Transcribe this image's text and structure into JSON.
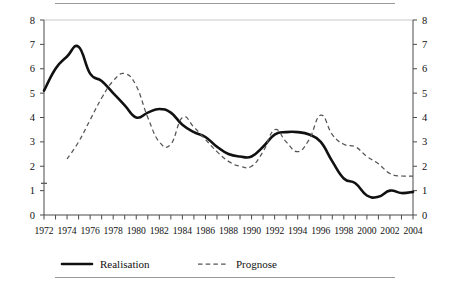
{
  "figure": {
    "name": "line-chart-realisation-prognose",
    "top_rule": "",
    "bottom_rule": ""
  },
  "chart_data": {
    "type": "line",
    "title": "",
    "subtitle": "",
    "xlabel": "",
    "ylabel": "",
    "xlim": [
      1972,
      2004
    ],
    "ylim": [
      0,
      8
    ],
    "grid": false,
    "legend_position": "bottom",
    "y_ticks": [
      0,
      1,
      2,
      3,
      4,
      5,
      6,
      7,
      8
    ],
    "y_tick_labels_left": [
      "0",
      "1",
      "2",
      "3",
      "4",
      "5",
      "6",
      "7",
      "8"
    ],
    "y_tick_labels_right": [
      "0",
      "1",
      "2",
      "3",
      "4",
      "5",
      "6",
      "7",
      "8"
    ],
    "x_ticks": [
      1972,
      1973,
      1974,
      1975,
      1976,
      1977,
      1978,
      1979,
      1980,
      1981,
      1982,
      1983,
      1984,
      1985,
      1986,
      1987,
      1988,
      1989,
      1990,
      1991,
      1992,
      1993,
      1994,
      1995,
      1996,
      1997,
      1998,
      1999,
      2000,
      2001,
      2002,
      2003,
      2004
    ],
    "x_tick_labels": [
      "1972",
      "1974",
      "1976",
      "1978",
      "1980",
      "1982",
      "1984",
      "1986",
      "1988",
      "1990",
      "1992",
      "1994",
      "1996",
      "1998",
      "2000",
      "2002",
      "2004"
    ],
    "x_labelled_years": [
      1972,
      1974,
      1976,
      1978,
      1980,
      1982,
      1984,
      1986,
      1988,
      1990,
      1992,
      1994,
      1996,
      1998,
      2000,
      2002,
      2004
    ],
    "x": [
      1972,
      1973,
      1974,
      1975,
      1976,
      1977,
      1978,
      1979,
      1980,
      1981,
      1982,
      1983,
      1984,
      1985,
      1986,
      1987,
      1988,
      1989,
      1990,
      1991,
      1992,
      1993,
      1994,
      1995,
      1996,
      1997,
      1998,
      1999,
      2000,
      2001,
      2002,
      2003,
      2004
    ],
    "series": [
      {
        "name": "Realisation",
        "style": "solid",
        "color": "#111111",
        "values": [
          5.1,
          6.0,
          6.5,
          6.9,
          5.8,
          5.5,
          5.0,
          4.5,
          4.0,
          4.2,
          4.35,
          4.2,
          3.7,
          3.4,
          3.2,
          2.8,
          2.5,
          2.4,
          2.4,
          2.8,
          3.3,
          3.4,
          3.4,
          3.3,
          3.0,
          2.2,
          1.5,
          1.3,
          0.8,
          0.75,
          1.0,
          0.9,
          0.95
        ]
      },
      {
        "name": "Prognose",
        "style": "dashed",
        "color": "#555555",
        "values": [
          1.3,
          null,
          2.3,
          3.0,
          3.9,
          4.8,
          5.5,
          5.8,
          5.3,
          4.0,
          3.0,
          2.9,
          4.0,
          3.6,
          3.1,
          2.6,
          2.2,
          2.0,
          2.0,
          2.6,
          3.5,
          3.0,
          2.6,
          3.1,
          4.1,
          3.3,
          2.9,
          2.8,
          2.4,
          2.1,
          1.7,
          1.6,
          1.6
        ]
      }
    ],
    "legend": [
      {
        "label": "Realisation",
        "style": "solid"
      },
      {
        "label": "Prognose",
        "style": "dashed"
      }
    ],
    "annotations": []
  }
}
